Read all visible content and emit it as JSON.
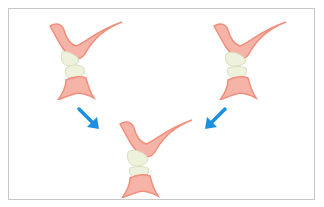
{
  "diagram": {
    "type": "dental-occlusion-illustration",
    "figures": [
      {
        "id": "left",
        "label": ""
      },
      {
        "id": "right",
        "label": ""
      },
      {
        "id": "result",
        "label": ""
      }
    ],
    "arrows": [
      {
        "from": "left",
        "to": "result",
        "direction": "down-right"
      },
      {
        "from": "right",
        "to": "result",
        "direction": "down-left"
      }
    ],
    "colors": {
      "gum": "#f6b3a8",
      "gum_outline": "#ef8f7c",
      "tooth": "#eef2dc",
      "tooth_outline": "#d9dfbd",
      "arrow": "#1b8fe0",
      "frame_border": "#c8c8c8"
    }
  }
}
